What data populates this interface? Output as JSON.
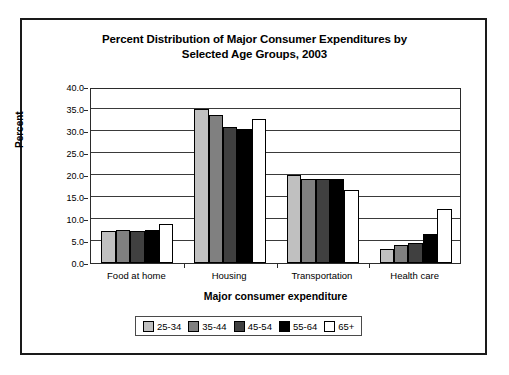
{
  "chart_data": {
    "type": "bar",
    "title": "Percent Distribution of Major Consumer Expenditures by Selected Age Groups, 2003",
    "title_line1": "Percent Distribution of Major Consumer Expenditures by",
    "title_line2": "Selected Age Groups, 2003",
    "xlabel": "Major consumer expenditure",
    "ylabel": "Percent",
    "categories": [
      "Food at home",
      "Housing",
      "Transportation",
      "Health care"
    ],
    "ylim": [
      0.0,
      40.0
    ],
    "ytick_labels": [
      "0.0",
      "5.0",
      "10.0",
      "15.0",
      "20.0",
      "25.0",
      "30.0",
      "35.0",
      "40.0"
    ],
    "ytick_values": [
      0.0,
      5.0,
      10.0,
      15.0,
      20.0,
      25.0,
      30.0,
      35.0,
      40.0
    ],
    "grid": true,
    "legend_position": "bottom",
    "series": [
      {
        "name": "25-34",
        "color": "#c0c0c0",
        "values": [
          7.2,
          35.0,
          20.1,
          3.2
        ]
      },
      {
        "name": "35-44",
        "color": "#808080",
        "values": [
          7.6,
          33.6,
          19.2,
          4.1
        ]
      },
      {
        "name": "45-54",
        "color": "#404040",
        "values": [
          7.3,
          31.0,
          19.2,
          4.6
        ]
      },
      {
        "name": "55-64",
        "color": "#000000",
        "values": [
          7.5,
          30.5,
          19.1,
          6.5
        ]
      },
      {
        "name": "65+",
        "color": "#ffffff",
        "values": [
          8.8,
          32.8,
          16.5,
          12.3
        ]
      }
    ]
  }
}
